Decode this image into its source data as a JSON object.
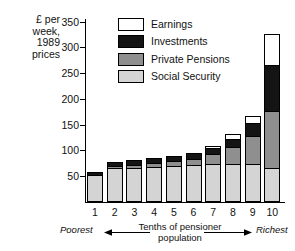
{
  "axis_title_lines": [
    "£ per",
    "week,",
    "1989",
    "prices"
  ],
  "legend": {
    "items": [
      {
        "label": "Earnings",
        "key": "earnings",
        "color": "#ffffff"
      },
      {
        "label": "Investments",
        "key": "investments",
        "color": "#141414"
      },
      {
        "label": "Private Pensions",
        "key": "pensions",
        "color": "#8f8f8f"
      },
      {
        "label": "Social Security",
        "key": "social",
        "color": "#d4d4d4"
      }
    ]
  },
  "caption": {
    "poorest": "Poorest",
    "richest": "Richest",
    "middle_line1": "Tenths of pensioner",
    "middle_line2": "population"
  },
  "chart_data": {
    "type": "bar",
    "stacked": true,
    "title": "",
    "xlabel": "Tenths of pensioner population",
    "ylabel": "£ per week, 1989 prices",
    "categories": [
      "1",
      "2",
      "3",
      "4",
      "5",
      "6",
      "7",
      "8",
      "9",
      "10"
    ],
    "ylim": [
      0,
      350
    ],
    "yticks": [
      50,
      100,
      150,
      200,
      250,
      300,
      350
    ],
    "grid": false,
    "legend_position": "top-center",
    "series": [
      {
        "name": "Social Security",
        "color": "#d4d4d4",
        "values": [
          52,
          65,
          66,
          68,
          70,
          71,
          73,
          73,
          73,
          65
        ]
      },
      {
        "name": "Private Pensions",
        "color": "#8f8f8f",
        "values": [
          0,
          4,
          6,
          8,
          9,
          12,
          20,
          33,
          55,
          110
        ]
      },
      {
        "name": "Investments",
        "color": "#141414",
        "values": [
          5,
          6,
          7,
          8,
          9,
          10,
          12,
          17,
          26,
          90
        ]
      },
      {
        "name": "Earnings",
        "color": "#ffffff",
        "values": [
          0,
          0,
          0,
          0,
          0,
          0,
          1,
          7,
          12,
          60
        ]
      }
    ],
    "totals": [
      57,
      75,
      79,
      84,
      88,
      93,
      106,
      130,
      166,
      325
    ],
    "annotations": [
      "Poorest",
      "Richest"
    ]
  }
}
